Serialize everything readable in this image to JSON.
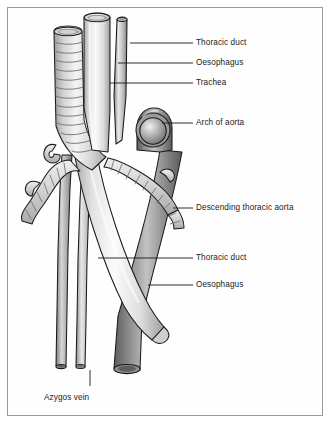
{
  "figure": {
    "background_color": "#ffffff",
    "frame_color": "#9a9a9a",
    "line_color": "#1a1a1a"
  },
  "labels": [
    {
      "id": "thoracic-duct-upper",
      "text": "Thoracic duct",
      "x": 196,
      "y": 38,
      "leader_x1": 130,
      "leader_y1": 43,
      "leader_x2": 193,
      "leader_y2": 43
    },
    {
      "id": "oesophagus-upper",
      "text": "Oesophagus",
      "x": 196,
      "y": 58,
      "leader_x1": 118,
      "leader_y1": 63,
      "leader_x2": 193,
      "leader_y2": 63
    },
    {
      "id": "trachea",
      "text": "Trachea",
      "x": 196,
      "y": 78,
      "leader_x1": 110,
      "leader_y1": 83,
      "leader_x2": 193,
      "leader_y2": 83
    },
    {
      "id": "arch-of-aorta",
      "text": "Arch of aorta",
      "x": 196,
      "y": 118,
      "leader_x1": 162,
      "leader_y1": 123,
      "leader_x2": 193,
      "leader_y2": 123
    },
    {
      "id": "descending-thoracic-aorta",
      "text": "Descending thoracic aorta",
      "x": 196,
      "y": 203,
      "leader_x1": 173,
      "leader_y1": 208,
      "leader_x2": 193,
      "leader_y2": 208
    },
    {
      "id": "thoracic-duct-lower",
      "text": "Thoracic duct",
      "x": 196,
      "y": 253,
      "leader_x1": 98,
      "leader_y1": 258,
      "leader_x2": 193,
      "leader_y2": 258
    },
    {
      "id": "oesophagus-lower",
      "text": "Oesophagus",
      "x": 196,
      "y": 280,
      "leader_x1": 148,
      "leader_y1": 285,
      "leader_x2": 193,
      "leader_y2": 285
    },
    {
      "id": "azygos-vein",
      "text": "Azygos vein",
      "x": 44,
      "y": 393,
      "leader_x1": 90,
      "leader_y1": 370,
      "leader_x2": 90,
      "leader_y2": 386
    }
  ],
  "structures": [
    {
      "id": "trachea",
      "name": "Trachea",
      "style": "cartilaginous ringed tube",
      "tone": "#dcdcdc"
    },
    {
      "id": "oesophagus",
      "name": "Oesophagus",
      "style": "smooth pale tube",
      "tone": "#efefef"
    },
    {
      "id": "thoracic-duct",
      "name": "Thoracic duct",
      "style": "thin slender tube",
      "tone": "#b8b8b8"
    },
    {
      "id": "arch-of-aorta",
      "name": "Arch of aorta",
      "style": "rounded arch cap",
      "tone": "#8e8e8e"
    },
    {
      "id": "descending-thoracic-aorta",
      "name": "Descending thoracic aorta",
      "style": "mid-grey tube",
      "tone": "#8a8a8a"
    },
    {
      "id": "azygos-vein",
      "name": "Azygos vein",
      "style": "thin dark tube",
      "tone": "#9c9c9c"
    },
    {
      "id": "left-main-bronchus",
      "name": "Left main bronchus",
      "style": "ringed branching tube",
      "tone": "#cfcfcf"
    },
    {
      "id": "right-main-bronchus",
      "name": "Right main bronchus",
      "style": "ringed branching tube",
      "tone": "#cfcfcf"
    }
  ]
}
